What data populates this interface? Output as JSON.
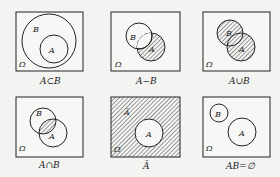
{
  "diagrams": [
    {
      "caption": "A⊂B",
      "universe": "Ω",
      "set_a": "A",
      "set_b": "B",
      "shaded": "none"
    },
    {
      "caption": "A−B",
      "universe": "Ω",
      "set_a": "A",
      "set_b": "B",
      "shaded": "A minus B"
    },
    {
      "caption": "A∪B",
      "universe": "Ω",
      "set_a": "A",
      "set_b": "B",
      "shaded": "A union B"
    },
    {
      "caption": "A∩B",
      "universe": "Ω",
      "set_a": "A",
      "set_b": "B",
      "shaded": "A intersect B"
    },
    {
      "caption": "Ā",
      "universe": "Ω",
      "set_a": "A",
      "complement_label": "Ā",
      "shaded": "complement of A"
    },
    {
      "caption": "AB=∅",
      "universe": "Ω",
      "set_a": "A",
      "set_b": "B",
      "shaded": "none"
    }
  ],
  "colors": {
    "stroke": "#222222",
    "background": "#f3f3f1",
    "box_fill": "#f7f7f5"
  }
}
